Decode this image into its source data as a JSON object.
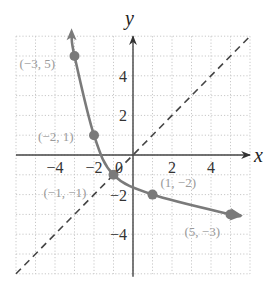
{
  "chart_data": {
    "type": "line",
    "title": "",
    "xlabel": "x",
    "ylabel": "y",
    "xlim": [
      -6,
      6
    ],
    "ylim": [
      -6,
      6
    ],
    "grid": true,
    "grid_style": "dotted",
    "x_ticks": [
      -4,
      -2,
      0,
      2,
      4
    ],
    "y_ticks": [
      4,
      2,
      -2,
      -4
    ],
    "x_tick_labels": [
      "−4",
      "−2",
      "0",
      "2",
      "4"
    ],
    "y_tick_labels": [
      "4",
      "2",
      "−2",
      "−4"
    ],
    "series": [
      {
        "name": "curve",
        "style": "solid",
        "color": "#7a7a7a",
        "arrows": "both",
        "points": [
          {
            "x": -3,
            "y": 5,
            "label": "(−3, 5)"
          },
          {
            "x": -2,
            "y": 1,
            "label": "(−2, 1)"
          },
          {
            "x": -1,
            "y": -1,
            "label": "(−1, −1)"
          },
          {
            "x": 1,
            "y": -2,
            "label": "(1, −2)"
          },
          {
            "x": 5,
            "y": -3,
            "label": "(5, −3)"
          }
        ]
      },
      {
        "name": "y = x",
        "style": "dashed",
        "color": "#444444",
        "points": [
          {
            "x": -6,
            "y": -6
          },
          {
            "x": 6,
            "y": 6
          }
        ]
      }
    ]
  },
  "colors": {
    "curve": "#7a7a7a",
    "dashed_line": "#444444",
    "axes": "#444444",
    "grid": "#c8c8c8",
    "point_label": "#9a9a9a"
  }
}
